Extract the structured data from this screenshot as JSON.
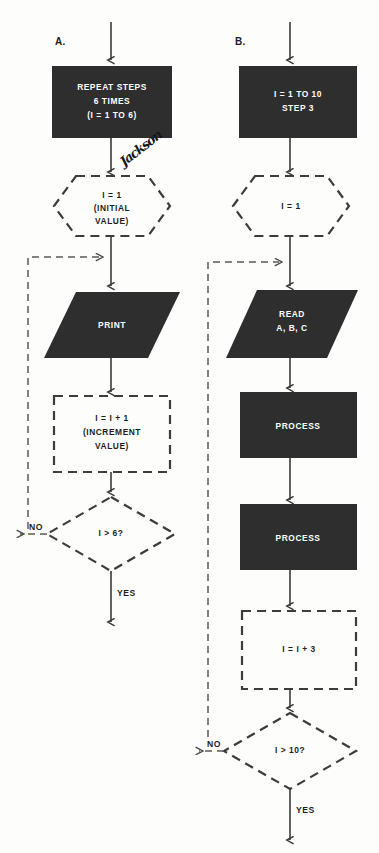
{
  "diagram": {
    "background_color": "#fdfdfc",
    "fill_color": "#2e2e2e",
    "line_color": "#3a3a3a",
    "dashed_color": "#3c3c3c"
  },
  "annotation": {
    "handwritten_note": "Jackson"
  },
  "panels": [
    {
      "letter": "A.",
      "nodes": {
        "loop_header": {
          "shape": "rectangle-filled",
          "lines": [
            "REPEAT STEPS",
            "6 TIMES",
            "(I = 1 TO 6)"
          ]
        },
        "init": {
          "shape": "hexagon-dashed",
          "lines": [
            "I = 1",
            "(INITIAL",
            "VALUE)"
          ]
        },
        "body": {
          "shape": "parallelogram-filled",
          "lines": [
            "PRINT"
          ]
        },
        "increment": {
          "shape": "rectangle-dashed",
          "lines": [
            "I = I + 1",
            "(INCREMENT",
            "VALUE)"
          ]
        },
        "decision": {
          "shape": "diamond-dashed",
          "lines": [
            "I > 6?"
          ],
          "no_label": "NO",
          "yes_label": "YES"
        }
      }
    },
    {
      "letter": "B.",
      "nodes": {
        "loop_header": {
          "shape": "rectangle-filled",
          "lines": [
            "I = 1 TO 10",
            "STEP 3"
          ]
        },
        "init": {
          "shape": "hexagon-dashed",
          "lines": [
            "I = 1"
          ]
        },
        "body_read": {
          "shape": "parallelogram-filled",
          "lines": [
            "READ",
            "A, B, C"
          ]
        },
        "process_one": {
          "shape": "rectangle-filled",
          "lines": [
            "PROCESS"
          ]
        },
        "process_two": {
          "shape": "rectangle-filled",
          "lines": [
            "PROCESS"
          ]
        },
        "increment": {
          "shape": "rectangle-dashed",
          "lines": [
            "I = I + 3"
          ]
        },
        "decision": {
          "shape": "diamond-dashed",
          "lines": [
            "I > 10?"
          ],
          "no_label": "NO",
          "yes_label": "YES"
        }
      }
    }
  ]
}
